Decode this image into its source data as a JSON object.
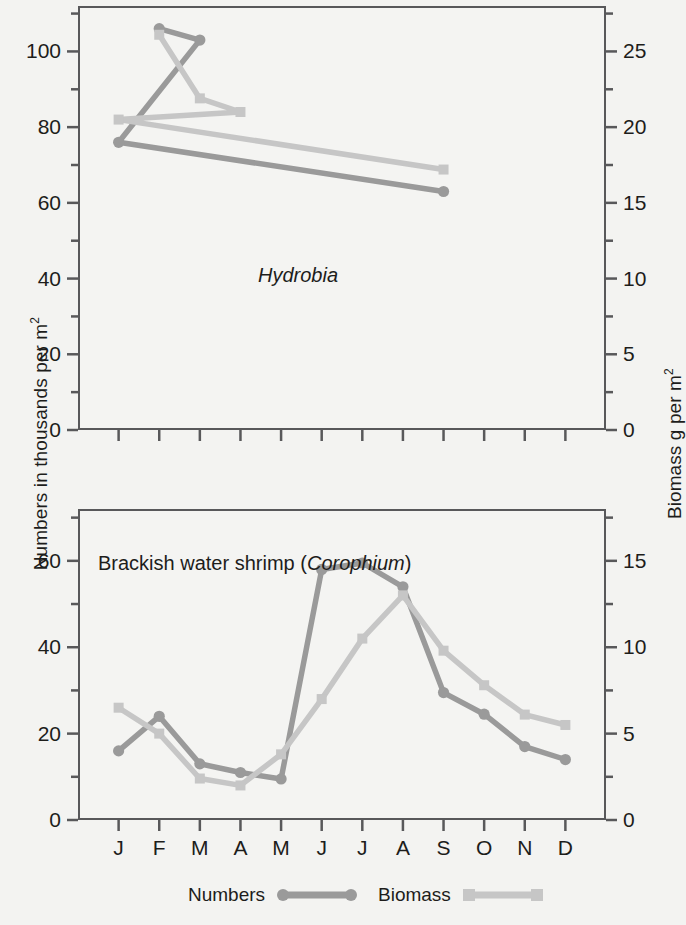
{
  "axes": {
    "left_title_text": "Numbers in thousands per m",
    "left_title_sup": "2",
    "right_title_text": "Biomass g per m",
    "right_title_sup": "2"
  },
  "legend": {
    "numbers_label": "Numbers",
    "biomass_label": "Biomass",
    "numbers_color": "#9a9a9a",
    "biomass_color": "#c4c4c4"
  },
  "panels": {
    "top": {
      "caption": "Hydrobia",
      "caption_italic": true
    },
    "bottom": {
      "caption_prefix": "Brackish water shrimp (",
      "caption_sci": "Corophium",
      "caption_suffix": ")"
    }
  },
  "chart_data": [
    {
      "id": "hydrobia",
      "type": "line",
      "title": "Hydrobia",
      "xlabel": "",
      "ylabel": "Numbers in thousands per m2",
      "y2label": "Biomass g per m2",
      "categories": [
        "J",
        "F",
        "M",
        "A",
        "M",
        "J",
        "J",
        "A",
        "S",
        "O",
        "N",
        "D"
      ],
      "ylim": [
        0,
        112
      ],
      "yticks": [
        0,
        20,
        40,
        60,
        80,
        100
      ],
      "yminorticks": [
        10,
        30,
        50,
        70,
        90,
        110
      ],
      "y2lim": [
        0,
        28
      ],
      "y2ticks": [
        0,
        5,
        10,
        15,
        20,
        25
      ],
      "y2minorticks": [
        2.5,
        7.5,
        12.5,
        17.5,
        22.5,
        27.5
      ],
      "grid": false,
      "legend_position": "below-figure",
      "series": [
        {
          "name": "Numbers",
          "axis": "left",
          "marker": "circle",
          "color": "#9a9a9a",
          "points": [
            {
              "x": "F",
              "y": 106
            },
            {
              "x": "M",
              "y": 103
            },
            {
              "x": "J",
              "y": 76
            },
            {
              "x": "S",
              "y": 63
            }
          ]
        },
        {
          "name": "Biomass",
          "axis": "right",
          "marker": "square",
          "color": "#c6c6c6",
          "points": [
            {
              "x": "F",
              "y": 26.1
            },
            {
              "x": "M",
              "y": 21.9
            },
            {
              "x": "A",
              "y": 21.0
            },
            {
              "x": "J",
              "y": 20.5
            },
            {
              "x": "S",
              "y": 17.2
            }
          ]
        }
      ]
    },
    {
      "id": "corophium",
      "type": "line",
      "title": "Brackish water shrimp (Corophium)",
      "xlabel": "",
      "ylabel": "Numbers in thousands per m2",
      "y2label": "Biomass g per m2",
      "categories": [
        "J",
        "F",
        "M",
        "A",
        "M",
        "J",
        "J",
        "A",
        "S",
        "O",
        "N",
        "D"
      ],
      "ylim": [
        0,
        72
      ],
      "yticks": [
        0,
        20,
        40,
        60
      ],
      "yminorticks": [
        10,
        30,
        50,
        70
      ],
      "y2lim": [
        0,
        18
      ],
      "y2ticks": [
        0,
        5,
        10,
        15
      ],
      "y2minorticks": [
        2.5,
        7.5,
        12.5,
        17.5
      ],
      "grid": false,
      "legend_position": "below-figure",
      "series": [
        {
          "name": "Numbers",
          "axis": "left",
          "marker": "circle",
          "color": "#9a9a9a",
          "values": [
            16,
            24,
            13,
            11,
            9.5,
            58,
            59.5,
            54,
            29.5,
            24.5,
            17,
            14
          ]
        },
        {
          "name": "Biomass",
          "axis": "right",
          "marker": "square",
          "color": "#c6c6c6",
          "values": [
            6.5,
            5.0,
            2.4,
            2.0,
            3.8,
            7.0,
            10.5,
            13.0,
            9.8,
            7.8,
            6.1,
            5.5
          ]
        }
      ]
    }
  ]
}
